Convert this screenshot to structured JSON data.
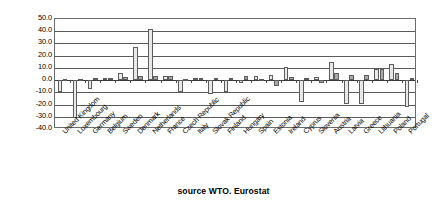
{
  "chart_data": {
    "type": "bar",
    "title": "",
    "subtitle": "",
    "caption": "source WTO. Eurostat",
    "xlabel": "",
    "ylabel": "",
    "ylim": [
      -40.0,
      50.0
    ],
    "ytick_step": 10.0,
    "grid": true,
    "legend": "none",
    "legend_position": "none",
    "yticks": [
      "50.0",
      "40.0",
      "30.0",
      "20.0",
      "10.0",
      "0.0",
      "-10.0",
      "-20.0",
      "-30.0",
      "-40.0"
    ],
    "categories": [
      "United Kingdom",
      "Luxembourg",
      "Germany",
      "Belgium",
      "Sweden",
      "Denmark",
      "Netherlands",
      "France",
      "Czech Republic",
      "Italy",
      "Slovak Republic",
      "Finland",
      "Hungary",
      "Spain",
      "Estonia",
      "Ireland",
      "Cyprus",
      "Slovenia",
      "Austria",
      "Latvia",
      "Greece",
      "Lithuania",
      "Poland",
      "Portugal"
    ],
    "series": [
      {
        "name": "Series 1",
        "values": [
          -9.5,
          -31.0,
          -7.5,
          2.0,
          5.5,
          27.5,
          41.5,
          3.0,
          -9.5,
          2.0,
          -11.5,
          -9.5,
          -2.5,
          3.0,
          4.0,
          11.0,
          -18.0,
          2.5,
          14.5,
          -19.5,
          -19.5,
          9.5,
          13.5,
          -22.0
        ],
        "color": "#e8e8e8"
      },
      {
        "name": "Series 2",
        "values": [
          1.0,
          1.0,
          2.0,
          2.0,
          2.5,
          3.0,
          3.0,
          3.5,
          1.0,
          2.0,
          2.0,
          2.0,
          3.5,
          1.0,
          -4.5,
          2.5,
          2.0,
          -2.0,
          6.0,
          4.0,
          4.5,
          9.5,
          5.5,
          1.5
        ],
        "color": "#a8a8a8"
      }
    ]
  },
  "colors": {
    "series1": "#e8e8e8",
    "series2": "#a8a8a8",
    "axis": "#5a5a5a",
    "text": "#000000",
    "background": "#ffffff"
  }
}
